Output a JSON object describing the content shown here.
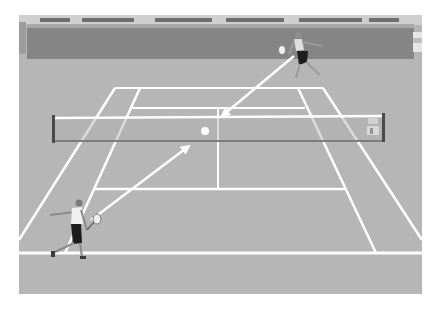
{
  "scene": {
    "description": "Tennis court illustration with two players and arrows showing ball trajectory",
    "frame": {
      "x": 19,
      "y": 15,
      "width": 403,
      "height": 279
    },
    "colors": {
      "background": "#ffffff",
      "court": "#b4b4b4",
      "court_far": "#b9b9b9",
      "wall": "#8a8a8a",
      "wall_top": "#a9a9a9",
      "stands": "#c8c8c8",
      "lines": "#ffffff",
      "net_shadow": "#7f7f7f",
      "post": "#4a4a4a",
      "player_skin": "#9a9a9a",
      "player_shirt": "#eeeeee",
      "player_shorts": "#222222",
      "ball": "#ffffff"
    },
    "stands_text": [
      "~~~~~ ~~~~~~",
      "~~~~~~~~~",
      "~~~~~~~~~",
      "~~~~~~~~ ~~~~"
    ]
  },
  "court": {
    "far_baseline": {
      "y": 88,
      "x1": 115,
      "x2": 323
    },
    "far_service_line": {
      "y": 108,
      "x1": 130,
      "x2": 305
    },
    "net": {
      "top_y": 118,
      "bottom_y": 141,
      "left_x": 53,
      "right_x": 384
    },
    "near_service_line": {
      "y": 189,
      "x1": 93,
      "x2": 345
    },
    "near_baseline": {
      "y": 253,
      "x1": 19,
      "x2": 422
    },
    "center_line_x": 218,
    "left_doubles": {
      "x_top": 115,
      "y_top": 88,
      "x_bot": 19,
      "y_bot": 240
    },
    "right_doubles": {
      "x_top": 323,
      "y_top": 88,
      "x_bot": 422,
      "y_bot": 240
    },
    "left_singles": {
      "x_top": 140,
      "y_top": 88,
      "x_bot": 65,
      "y_bot": 253
    },
    "right_singles": {
      "x_top": 298,
      "y_top": 88,
      "x_bot": 376,
      "y_bot": 253
    }
  },
  "players": [
    {
      "name": "far-player",
      "x": 300,
      "y": 55
    },
    {
      "name": "near-player",
      "x": 72,
      "y": 230
    }
  ],
  "ball": {
    "x": 205,
    "y": 131,
    "r": 4
  },
  "arrows": [
    {
      "name": "shot-arrow-far-to-net",
      "x1": 294,
      "y1": 55,
      "x2": 220,
      "y2": 117
    },
    {
      "name": "shot-arrow-near-to-net",
      "x1": 90,
      "y1": 221,
      "x2": 190,
      "y2": 145
    }
  ]
}
